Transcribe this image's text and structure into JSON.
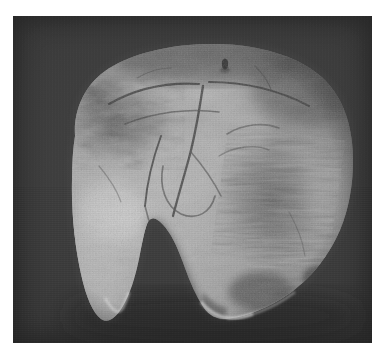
{
  "plate": {
    "kind": "photographic-plate",
    "medium": "black-and-white halftone photograph",
    "page_background": "#ffffff",
    "print_background": "#3b3b3b",
    "print_left": 13,
    "print_top": 16,
    "print_width": 359,
    "print_height": 327,
    "caption": ""
  },
  "subject": {
    "name": "cranial vault specimen",
    "description": "Human skull calvarium photographed against a plain dark studio backdrop",
    "view": "posterior-inferior oblique",
    "tone": "grayscale"
  },
  "palette": {
    "backdrop_dark": "#343434",
    "backdrop_mid": "#434343",
    "bone_highlight": "#f2f0ea",
    "bone_light": "#d8d4ca",
    "bone_mid": "#b3aea3",
    "bone_shadow": "#7d786f",
    "bone_deep_shadow": "#4d4a45",
    "stain_dark": "#52504b",
    "defect_void": "#303030",
    "paper_white": "#ffffff"
  },
  "features": [
    {
      "id": "vault-dome",
      "label": "cranial vault dome",
      "region": "upper"
    },
    {
      "id": "left-parietal",
      "label": "left parietal surface with bright specular highlight",
      "region": "lower-left"
    },
    {
      "id": "right-parietal",
      "label": "right parietal surface with dark streaked staining",
      "region": "right"
    },
    {
      "id": "sagittal-suture",
      "label": "sagittal suture running down the midline",
      "region": "center"
    },
    {
      "id": "lambdoid-suture",
      "label": "lambdoid suture arcs across the upper vault",
      "region": "upper-center"
    },
    {
      "id": "parietal-foramen",
      "label": "small dark parietal foramen",
      "region": "upper-center-right"
    },
    {
      "id": "inferior-defect",
      "label": "large dark V-shaped defect in the inferior margin",
      "region": "bottom-center"
    },
    {
      "id": "left-taper",
      "label": "left inferior margin tapering to a point",
      "region": "bottom-left"
    },
    {
      "id": "dark-mottling",
      "label": "dark mottled taphonomic staining",
      "region": "upper-left"
    }
  ],
  "accessibility": {
    "alt_text": "Grayscale photograph of a human skull cap (calvarium) seen from behind, with a large irregular break at its lower centre, mounted on a dark grey background within a white page margin."
  }
}
